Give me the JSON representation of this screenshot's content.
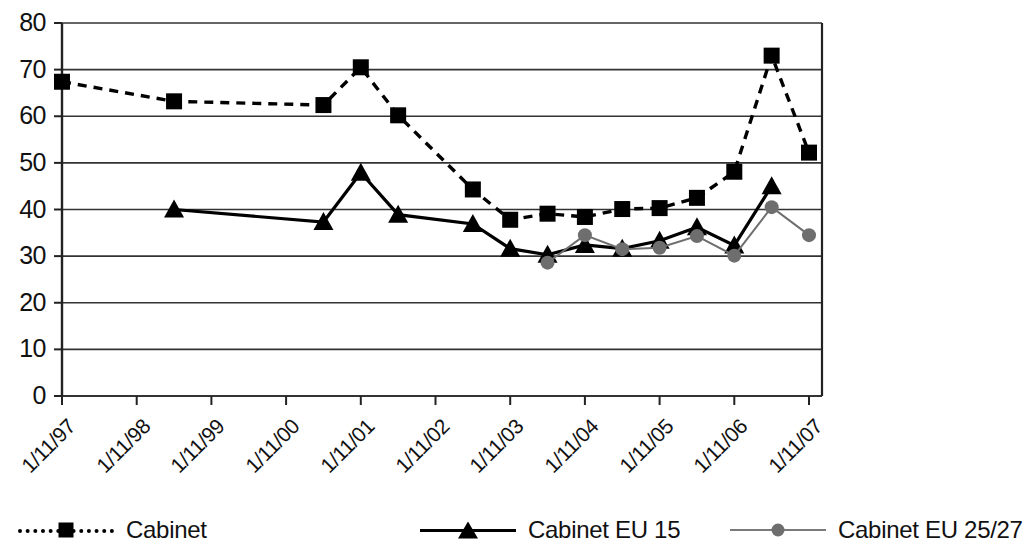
{
  "chart_data": {
    "type": "line",
    "title": "",
    "xlabel": "",
    "ylabel": "",
    "ylim": [
      0,
      80
    ],
    "ytick_step": 10,
    "yticks": [
      "80",
      "70",
      "60",
      "50",
      "40",
      "30",
      "20",
      "10",
      "0"
    ],
    "grid": true,
    "legend_position": "bottom",
    "categories": [
      "1/11/97",
      "1/11/98",
      "1/11/99",
      "1/11/00",
      "1/11/01",
      "1/11/02",
      "1/11/03",
      "1/11/04",
      "1/11/05",
      "1/11/06",
      "1/11/07"
    ],
    "xticks": [
      "1/11/97",
      "1/11/98",
      "1/11/99",
      "1/11/00",
      "1/11/01",
      "1/11/02",
      "1/11/03",
      "1/11/04",
      "1/11/05",
      "1/11/06",
      "1/11/07"
    ],
    "series": [
      {
        "name": "Cabinet",
        "style": "dashed",
        "marker": "square",
        "color": "#000000",
        "points": [
          {
            "x": "1/11/97",
            "y": 67.4
          },
          {
            "x": "1/11/98.5",
            "y": 63.2
          },
          {
            "x": "1/11/00.5",
            "y": 62.4
          },
          {
            "x": "1/11/01",
            "y": 70.5
          },
          {
            "x": "1/11/01.5",
            "y": 60.2
          },
          {
            "x": "1/11/02.5",
            "y": 44.3
          },
          {
            "x": "1/11/03",
            "y": 37.8
          },
          {
            "x": "1/11/03.5",
            "y": 39.1
          },
          {
            "x": "1/11/04",
            "y": 38.4
          },
          {
            "x": "1/11/04.5",
            "y": 40.1
          },
          {
            "x": "1/11/05",
            "y": 40.3
          },
          {
            "x": "1/11/05.5",
            "y": 42.5
          },
          {
            "x": "1/11/06",
            "y": 48.1
          },
          {
            "x": "1/11/06.5",
            "y": 73.0
          },
          {
            "x": "1/11/07",
            "y": 52.2
          }
        ]
      },
      {
        "name": "Cabinet EU 15",
        "style": "solid",
        "marker": "triangle",
        "color": "#000000",
        "points": [
          {
            "x": "1/11/98.5",
            "y": 40.0
          },
          {
            "x": "1/11/00.5",
            "y": 37.3
          },
          {
            "x": "1/11/01",
            "y": 47.9
          },
          {
            "x": "1/11/01.5",
            "y": 38.9
          },
          {
            "x": "1/11/02.5",
            "y": 36.9
          },
          {
            "x": "1/11/03",
            "y": 31.6
          },
          {
            "x": "1/11/03.5",
            "y": 30.3
          },
          {
            "x": "1/11/04",
            "y": 32.4
          },
          {
            "x": "1/11/04.5",
            "y": 31.6
          },
          {
            "x": "1/11/05",
            "y": 33.3
          },
          {
            "x": "1/11/05.5",
            "y": 36.2
          },
          {
            "x": "1/11/06",
            "y": 32.3
          },
          {
            "x": "1/11/06.5",
            "y": 45.0
          }
        ]
      },
      {
        "name": "Cabinet EU 25/27",
        "style": "thin",
        "marker": "circle",
        "color": "#6e6e6e",
        "points": [
          {
            "x": "1/11/03.5",
            "y": 28.6
          },
          {
            "x": "1/11/04",
            "y": 34.5
          },
          {
            "x": "1/11/04.5",
            "y": 31.5
          },
          {
            "x": "1/11/05",
            "y": 31.8
          },
          {
            "x": "1/11/05.5",
            "y": 34.3
          },
          {
            "x": "1/11/06",
            "y": 30.1
          },
          {
            "x": "1/11/06.5",
            "y": 40.5
          },
          {
            "x": "1/11/07",
            "y": 34.5
          }
        ]
      }
    ]
  },
  "legend": {
    "entries": [
      {
        "label": "Cabinet",
        "key": "dashed-square-key"
      },
      {
        "label": "Cabinet EU 15",
        "key": "solid-triangle-key"
      },
      {
        "label": "Cabinet EU 25/27",
        "key": "thin-circle-key"
      }
    ]
  }
}
